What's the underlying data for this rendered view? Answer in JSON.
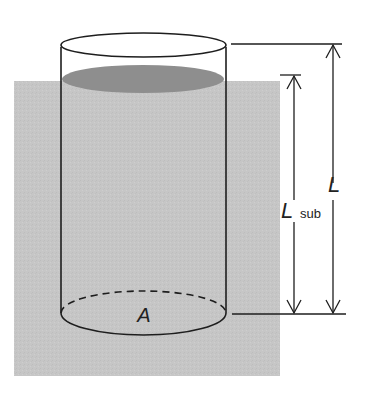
{
  "diagram": {
    "type": "physics-illustration",
    "labels": {
      "area": "A",
      "length_total": "L",
      "length_sub_main": "L",
      "length_sub_subscript": "sub"
    },
    "colors": {
      "fluid": "#c4c4c4",
      "liquid_surface": "#8e8e8e",
      "outline": "#1e1e1e",
      "background": "#ffffff"
    }
  }
}
